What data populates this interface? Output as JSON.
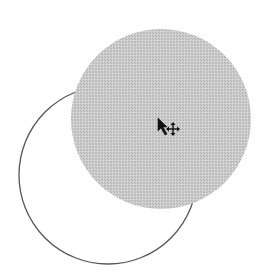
{
  "canvas": {
    "background": "#ffffff",
    "outline_circle": {
      "cx": 108,
      "cy": 175,
      "r": 89,
      "stroke": "#555555",
      "stroke_width": 1.3
    },
    "filled_circle": {
      "cx": 161,
      "cy": 119,
      "r": 90,
      "fill": "#c8c8c8",
      "pattern_color": "#b4b4b4"
    },
    "cursor": {
      "type": "move-cursor",
      "x": 160,
      "y": 122
    }
  }
}
